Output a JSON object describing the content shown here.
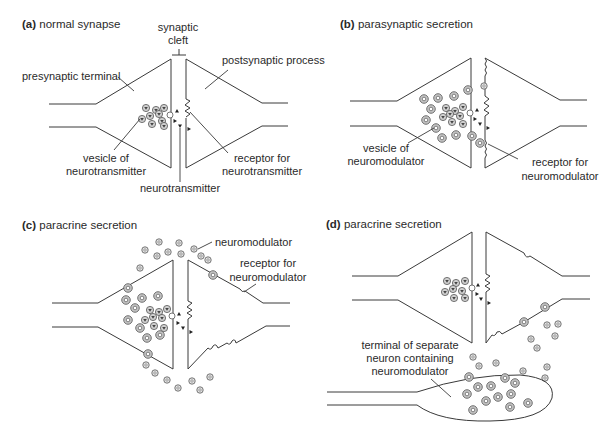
{
  "figure": {
    "panels": [
      {
        "id": "a",
        "letter": "(a)",
        "title": "normal synapse",
        "labels": {
          "cleft_line1": "synaptic",
          "cleft_line2": "cleft",
          "presynaptic": "presynaptic terminal",
          "postsynaptic": "postsynaptic process",
          "vesicle_line1": "vesicle of",
          "vesicle_line2": "neurotransmitter",
          "receptor_line1": "receptor for",
          "receptor_line2": "neurotransmitter",
          "transmitter": "neurotransmitter"
        }
      },
      {
        "id": "b",
        "letter": "(b)",
        "title": "parasynaptic secretion",
        "labels": {
          "vesicle_line1": "vesicle of",
          "vesicle_line2": "neuromodulator",
          "receptor_line1": "receptor for",
          "receptor_line2": "neuromodulator"
        }
      },
      {
        "id": "c",
        "letter": "(c)",
        "title": "paracrine secretion",
        "labels": {
          "modulator": "neuromodulator",
          "receptor_line1": "receptor for",
          "receptor_line2": "neuromodulator"
        }
      },
      {
        "id": "d",
        "letter": "(d)",
        "title": "paracrine secretion",
        "labels": {
          "terminal_line1": "terminal of separate",
          "terminal_line2": "neuron containing",
          "terminal_line3": "neuromodulator"
        }
      }
    ],
    "colors": {
      "line": "#3a3a3a",
      "vesicle_fill": "#c8c8c8",
      "background": "#ffffff"
    }
  }
}
